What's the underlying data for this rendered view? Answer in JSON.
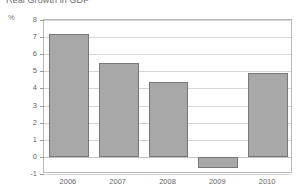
{
  "chart_data": {
    "type": "bar",
    "title": "Real Growth in GDP",
    "xlabel": "",
    "ylabel": "%",
    "categories": [
      "2006",
      "2007",
      "2008",
      "2009",
      "2010"
    ],
    "values": [
      7.2,
      5.5,
      4.4,
      -0.65,
      4.9
    ],
    "series": [
      {
        "name": "Real Growth in GDP",
        "values": [
          7.2,
          5.5,
          4.4,
          -0.65,
          4.9
        ]
      }
    ],
    "ylim": [
      -1,
      8
    ],
    "ytick_step": 1,
    "yticks": [
      "8",
      "7",
      "6",
      "5",
      "4",
      "3",
      "2",
      "1",
      "0",
      "-1"
    ],
    "grid": true,
    "legend": "none",
    "bar_color": "#a8a8a8",
    "bar_edge_color": "#777777",
    "gridline_color": "#d6d6d6",
    "axis_color": "#b9b9b9",
    "background_color": "#ffffff",
    "text_color": "#666666"
  }
}
